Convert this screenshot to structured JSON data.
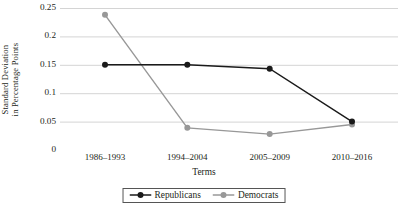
{
  "chart_data": {
    "type": "line",
    "title": "",
    "xlabel": "Terms",
    "ylabel": "Standard Deviation in Percentage Points",
    "ylabel_line1": "Standard Deviation",
    "ylabel_line2": "in Percentage Points",
    "categories": [
      "1986–1993",
      "1994–2004",
      "2005–2009",
      "2010–2016"
    ],
    "yticks": [
      "0",
      "0.05",
      "0.1",
      "0.15",
      "0.2",
      "0.25"
    ],
    "ytick_values": [
      0,
      0.05,
      0.1,
      0.15,
      0.2,
      0.25
    ],
    "ylim": [
      0,
      0.25
    ],
    "grid": "horizontal",
    "legend_position": "bottom",
    "series": [
      {
        "name": "Republicans",
        "color": "#1a1a1a",
        "marker": "circle",
        "values": [
          0.15,
          0.15,
          0.143,
          0.05
        ]
      },
      {
        "name": "Democrats",
        "color": "#989898",
        "marker": "circle",
        "values": [
          0.238,
          0.039,
          0.028,
          0.045
        ]
      }
    ]
  },
  "colors": {
    "republicans": "#1a1a1a",
    "democrats": "#989898",
    "grid": "#d4d4d4",
    "text": "#231f20",
    "legend_border": "#555555"
  }
}
